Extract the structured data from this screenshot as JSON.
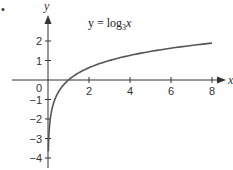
{
  "chart_data": {
    "type": "line",
    "title": "",
    "function": "y = log3(x)",
    "annotation": {
      "text_prefix": "y = log",
      "subscript": "3",
      "text_suffix": "x"
    },
    "xlabel": "x",
    "ylabel": "y",
    "xlim": [
      -2,
      8.5
    ],
    "ylim": [
      -4.2,
      3
    ],
    "x_ticks": [
      2,
      4,
      6,
      8
    ],
    "x_tick_labels": [
      "2",
      "4",
      "6",
      "8"
    ],
    "y_ticks": [
      2,
      1,
      0,
      -1,
      -2,
      -3,
      -4
    ],
    "y_tick_labels": [
      "2",
      "1",
      "0",
      "−1",
      "−2",
      "−3",
      "−4"
    ],
    "grid": false,
    "legend": null,
    "series": [
      {
        "name": "y = log3 x",
        "x": [
          0.02,
          0.05,
          0.1,
          0.2,
          0.333,
          0.5,
          1,
          2,
          3,
          4,
          5,
          6,
          7,
          8
        ],
        "y": [
          -3.56,
          -2.73,
          -2.1,
          -1.46,
          -1.0,
          -0.63,
          0,
          0.63,
          1.0,
          1.26,
          1.46,
          1.63,
          1.77,
          1.89
        ]
      }
    ],
    "colors": {
      "curve": "#555555",
      "axes": "#333333"
    }
  },
  "bullet": "•"
}
